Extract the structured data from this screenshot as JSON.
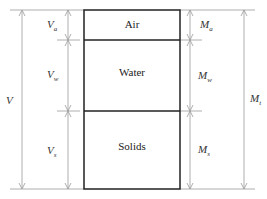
{
  "diagram": {
    "phases": [
      {
        "name": "Air",
        "top": 10,
        "bottom": 40
      },
      {
        "name": "Water",
        "top": 40,
        "bottom": 111
      },
      {
        "name": "Solids",
        "top": 111,
        "bottom": 189
      }
    ],
    "volume_labels": {
      "total": {
        "main": "V",
        "sub": ""
      },
      "air": {
        "main": "V",
        "sub": "a"
      },
      "water": {
        "main": "V",
        "sub": "w"
      },
      "solids": {
        "main": "V",
        "sub": "s"
      }
    },
    "mass_labels": {
      "total": {
        "main": "M",
        "sub": "t"
      },
      "air": {
        "main": "M",
        "sub": "a"
      },
      "water": {
        "main": "M",
        "sub": "w"
      },
      "solids": {
        "main": "M",
        "sub": "s"
      }
    },
    "colors": {
      "box": "#222222",
      "dim": "#999999"
    }
  }
}
